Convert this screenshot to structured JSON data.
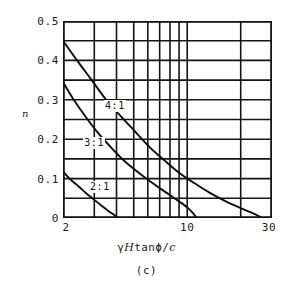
{
  "figure": {
    "caption": "(c)",
    "y_axis_title": "n",
    "x_axis_title_parts": {
      "gamma": "γ",
      "h": "H",
      "tan": "tan",
      "phi": "ϕ",
      "slash": "/",
      "c": "c"
    },
    "x_axis_title_plain": "γHtanϕ/c"
  },
  "chart_data": {
    "type": "line",
    "title": "",
    "subtitle": "",
    "xlabel": "γHtanϕ/c",
    "ylabel": "n",
    "xscale": "log",
    "yscale": "linear",
    "xlim": [
      2,
      30
    ],
    "ylim": [
      0,
      0.5
    ],
    "grid": true,
    "legend_position": "inline-curve-labels",
    "x_ticks": [
      {
        "value": 2,
        "label": "2"
      },
      {
        "value": 10,
        "label": "10"
      },
      {
        "value": 30,
        "label": "30"
      }
    ],
    "x_gridlines": [
      2,
      3,
      4,
      5,
      6,
      7,
      8,
      9,
      10,
      20,
      30
    ],
    "y_ticks": [
      {
        "value": 0.5,
        "label": "0.5"
      },
      {
        "value": 0.4,
        "label": "0.4"
      },
      {
        "value": 0.3,
        "label": "0.3"
      },
      {
        "value": 0.2,
        "label": "0.2"
      },
      {
        "value": 0.1,
        "label": "0.1"
      },
      {
        "value": 0,
        "label": "0"
      }
    ],
    "y_gridlines": [
      0,
      0.05,
      0.1,
      0.15,
      0.2,
      0.25,
      0.3,
      0.35,
      0.4,
      0.45,
      0.5
    ],
    "series": [
      {
        "name": "4:1",
        "label": "4:1",
        "label_at": {
          "x": 3.4,
          "y": 0.285
        },
        "points": [
          [
            2.0,
            0.45
          ],
          [
            2.4,
            0.4
          ],
          [
            2.9,
            0.35
          ],
          [
            3.5,
            0.3
          ],
          [
            4.3,
            0.255
          ],
          [
            5.2,
            0.215
          ],
          [
            6.2,
            0.178
          ],
          [
            7.5,
            0.145
          ],
          [
            9.0,
            0.115
          ],
          [
            11.0,
            0.088
          ],
          [
            13.5,
            0.063
          ],
          [
            16.5,
            0.042
          ],
          [
            20.0,
            0.025
          ],
          [
            24.0,
            0.01
          ],
          [
            26.5,
            0.0
          ]
        ]
      },
      {
        "name": "3:1",
        "label": "3:1",
        "label_at": {
          "x": 2.6,
          "y": 0.19
        },
        "points": [
          [
            2.0,
            0.345
          ],
          [
            2.3,
            0.3
          ],
          [
            2.7,
            0.255
          ],
          [
            3.2,
            0.212
          ],
          [
            3.8,
            0.175
          ],
          [
            4.5,
            0.142
          ],
          [
            5.4,
            0.113
          ],
          [
            6.4,
            0.088
          ],
          [
            7.6,
            0.065
          ],
          [
            8.8,
            0.045
          ],
          [
            10.0,
            0.027
          ],
          [
            10.8,
            0.012
          ],
          [
            11.3,
            0.0
          ]
        ]
      },
      {
        "name": "2:1",
        "label": "2:1",
        "label_at": {
          "x": 2.8,
          "y": 0.078
        },
        "points": [
          [
            2.0,
            0.118
          ],
          [
            2.2,
            0.098
          ],
          [
            2.45,
            0.08
          ],
          [
            2.7,
            0.063
          ],
          [
            3.0,
            0.046
          ],
          [
            3.3,
            0.031
          ],
          [
            3.6,
            0.018
          ],
          [
            3.9,
            0.007
          ],
          [
            4.1,
            0.0
          ]
        ]
      }
    ]
  }
}
